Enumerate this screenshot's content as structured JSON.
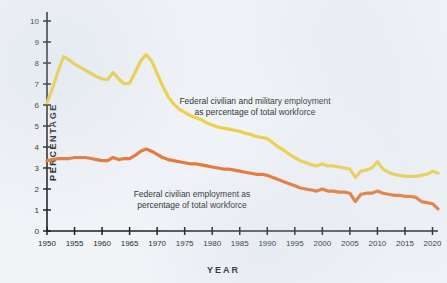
{
  "chart_data": {
    "type": "line",
    "title": "",
    "xlabel": "YEAR",
    "ylabel": "PERCENTAGE",
    "xlim": [
      1950,
      2021
    ],
    "ylim": [
      0,
      10
    ],
    "grid": false,
    "legend_position": "inline-annotation",
    "x_ticks": [
      "1950",
      "1955",
      "1960",
      "1965",
      "1970",
      "1975",
      "1980",
      "1985",
      "1990",
      "1995",
      "2000",
      "2005",
      "2010",
      "2015",
      "2020"
    ],
    "y_ticks": [
      "0",
      "1",
      "2",
      "3",
      "4",
      "5",
      "6",
      "7",
      "8",
      "9",
      "10"
    ],
    "x": [
      1950,
      1951,
      1952,
      1953,
      1954,
      1955,
      1956,
      1957,
      1958,
      1959,
      1960,
      1961,
      1962,
      1963,
      1964,
      1965,
      1966,
      1967,
      1968,
      1969,
      1970,
      1971,
      1972,
      1973,
      1974,
      1975,
      1976,
      1977,
      1978,
      1979,
      1980,
      1981,
      1982,
      1983,
      1984,
      1985,
      1986,
      1987,
      1988,
      1989,
      1990,
      1991,
      1992,
      1993,
      1994,
      1995,
      1996,
      1997,
      1998,
      1999,
      2000,
      2001,
      2002,
      2003,
      2004,
      2005,
      2006,
      2007,
      2008,
      2009,
      2010,
      2011,
      2012,
      2013,
      2014,
      2015,
      2016,
      2017,
      2018,
      2019,
      2020,
      2021
    ],
    "series": [
      {
        "name": "Federal civilian and military employment as percentage of total workforce",
        "color": "#EFD040",
        "values": [
          6.1,
          6.8,
          7.6,
          8.3,
          8.15,
          7.95,
          7.8,
          7.65,
          7.5,
          7.35,
          7.25,
          7.2,
          7.55,
          7.25,
          7.0,
          7.05,
          7.55,
          8.1,
          8.4,
          8.1,
          7.5,
          6.9,
          6.4,
          6.05,
          5.8,
          5.65,
          5.5,
          5.4,
          5.3,
          5.15,
          5.05,
          4.95,
          4.9,
          4.85,
          4.8,
          4.75,
          4.65,
          4.6,
          4.5,
          4.45,
          4.4,
          4.2,
          4.0,
          3.85,
          3.65,
          3.5,
          3.35,
          3.25,
          3.15,
          3.1,
          3.2,
          3.1,
          3.1,
          3.05,
          3.0,
          2.95,
          2.55,
          2.85,
          2.9,
          3.0,
          3.3,
          2.95,
          2.8,
          2.7,
          2.65,
          2.6,
          2.6,
          2.6,
          2.65,
          2.7,
          2.85,
          2.75
        ]
      },
      {
        "name": "Federal civilian employment as percentage of total workforce",
        "color": "#E8722A",
        "values": [
          3.35,
          3.4,
          3.45,
          3.45,
          3.45,
          3.5,
          3.5,
          3.5,
          3.45,
          3.4,
          3.35,
          3.35,
          3.5,
          3.4,
          3.45,
          3.45,
          3.6,
          3.8,
          3.9,
          3.8,
          3.65,
          3.5,
          3.4,
          3.35,
          3.3,
          3.25,
          3.2,
          3.2,
          3.15,
          3.1,
          3.05,
          3.0,
          2.95,
          2.95,
          2.9,
          2.85,
          2.8,
          2.75,
          2.7,
          2.7,
          2.65,
          2.55,
          2.45,
          2.35,
          2.25,
          2.15,
          2.05,
          2.0,
          1.95,
          1.9,
          2.0,
          1.9,
          1.9,
          1.85,
          1.85,
          1.8,
          1.4,
          1.75,
          1.8,
          1.8,
          1.9,
          1.8,
          1.75,
          1.7,
          1.7,
          1.65,
          1.65,
          1.6,
          1.4,
          1.35,
          1.3,
          1.05
        ]
      }
    ],
    "annotations": [
      {
        "id": "annotation-federal-total",
        "lines": [
          "Federal civilian and military employment",
          "as percentage of total workforce"
        ],
        "series": "Federal civilian and military employment as percentage of total workforce"
      },
      {
        "id": "annotation-federal-civilian",
        "lines": [
          "Federal civilian employment as",
          "percentage of total workforce"
        ],
        "series": "Federal civilian employment as percentage of total workforce"
      }
    ]
  },
  "colors": {
    "background": "#F2F5F8",
    "axis": "#1A1A1A",
    "text": "#1D1D1D",
    "series_total": "#EFD040",
    "series_civilian": "#E8722A"
  }
}
